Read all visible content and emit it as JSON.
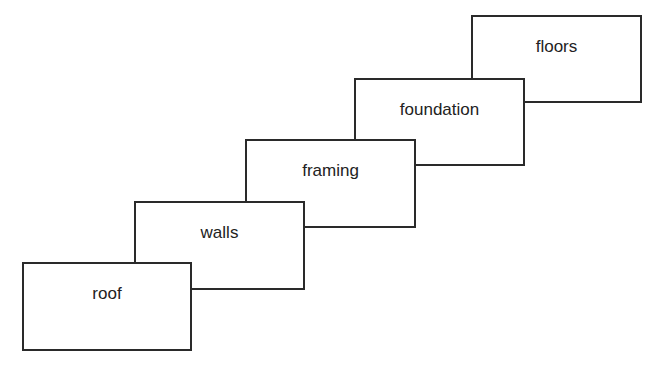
{
  "diagram": {
    "type": "staircase of overlapping boxes",
    "boxes": [
      {
        "label": "roof"
      },
      {
        "label": "walls"
      },
      {
        "label": "framing"
      },
      {
        "label": "foundation"
      },
      {
        "label": "floors"
      }
    ]
  }
}
